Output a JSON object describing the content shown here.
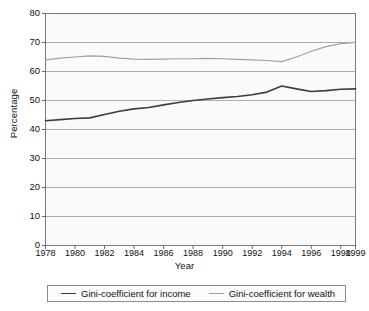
{
  "chart_data": {
    "type": "line",
    "title": "",
    "xlabel": "Year",
    "ylabel": "Percentage",
    "ylim": [
      0,
      80
    ],
    "ytick_step": 10,
    "yticks": [
      "80",
      "70",
      "60",
      "50",
      "40",
      "30",
      "20",
      "10",
      "0"
    ],
    "xlim": [
      1978,
      1999
    ],
    "x": [
      1978,
      1979,
      1980,
      1981,
      1982,
      1983,
      1984,
      1985,
      1986,
      1987,
      1988,
      1989,
      1990,
      1991,
      1992,
      1993,
      1994,
      1995,
      1996,
      1997,
      1998,
      1999
    ],
    "xticks": [
      "1978",
      "1980",
      "1982",
      "1984",
      "1986",
      "1988",
      "1990",
      "1992",
      "1994",
      "1996",
      "1998",
      "1999"
    ],
    "grid": true,
    "grid_axis": "y",
    "legend_position": "bottom",
    "series": [
      {
        "name": "Gini-coefficient for income",
        "color": "#3d3d3d",
        "values": [
          43.0,
          43.4,
          43.8,
          44.0,
          45.2,
          46.3,
          47.1,
          47.6,
          48.5,
          49.3,
          50.0,
          50.5,
          51.0,
          51.4,
          52.0,
          52.9,
          55.0,
          54.0,
          53.1,
          53.4,
          53.9,
          54.0
        ]
      },
      {
        "name": "Gini-coefficient for wealth",
        "color": "#a0a0a0",
        "values": [
          64.0,
          64.6,
          65.0,
          65.4,
          65.2,
          64.6,
          64.3,
          64.2,
          64.3,
          64.4,
          64.4,
          64.5,
          64.4,
          64.2,
          64.0,
          63.8,
          63.4,
          65.0,
          67.0,
          68.6,
          69.6,
          70.0
        ]
      }
    ]
  },
  "legend": {
    "entries": [
      {
        "label": "Gini-coefficient for income"
      },
      {
        "label": "Gini-coefficient for wealth"
      }
    ]
  }
}
